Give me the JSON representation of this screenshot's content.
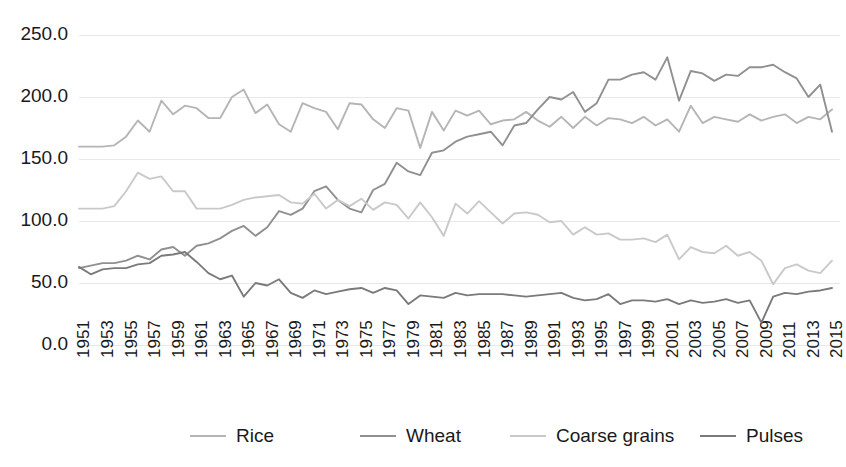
{
  "chart_data": {
    "type": "line",
    "title": "",
    "subtitle": "",
    "xlabel": "",
    "ylabel": "",
    "ylim": [
      0,
      250
    ],
    "ytick_labels": [
      "0.0",
      "50.0",
      "100.0",
      "150.0",
      "200.0",
      "250.0"
    ],
    "ytick_values": [
      0,
      50,
      100,
      150,
      200,
      250
    ],
    "grid": true,
    "legend_position": "bottom",
    "x": [
      1951,
      1952,
      1953,
      1954,
      1955,
      1956,
      1957,
      1958,
      1959,
      1960,
      1961,
      1962,
      1963,
      1964,
      1965,
      1966,
      1967,
      1968,
      1969,
      1970,
      1971,
      1972,
      1973,
      1974,
      1975,
      1976,
      1977,
      1978,
      1979,
      1980,
      1981,
      1982,
      1983,
      1984,
      1985,
      1986,
      1987,
      1988,
      1989,
      1990,
      1991,
      1992,
      1993,
      1994,
      1995,
      1996,
      1997,
      1998,
      1999,
      2000,
      2001,
      2002,
      2003,
      2004,
      2005,
      2006,
      2007,
      2008,
      2009,
      2010,
      2011,
      2012,
      2013,
      2014,
      2015
    ],
    "xtick_labels": [
      "1951",
      "1953",
      "1955",
      "1957",
      "1959",
      "1961",
      "1963",
      "1965",
      "1967",
      "1969",
      "1971",
      "1973",
      "1975",
      "1977",
      "1979",
      "1981",
      "1983",
      "1985",
      "1987",
      "1989",
      "1991",
      "1993",
      "1995",
      "1997",
      "1999",
      "2001",
      "2003",
      "2005",
      "2007",
      "2009",
      "2011",
      "2013",
      "2015"
    ],
    "series": [
      {
        "name": "Rice",
        "color": "#b5b5b5",
        "values": [
          160,
          160,
          160,
          161,
          168,
          181,
          172,
          197,
          186,
          193,
          191,
          183,
          183,
          200,
          206,
          187,
          194,
          178,
          172,
          195,
          191,
          188,
          174,
          195,
          194,
          182,
          175,
          191,
          189,
          159,
          188,
          173,
          189,
          185,
          189,
          178,
          181,
          182,
          188,
          181,
          176,
          184,
          175,
          184,
          177,
          183,
          182,
          179,
          184,
          177,
          182,
          172,
          193,
          179,
          184,
          182,
          180,
          186,
          181,
          184,
          186,
          179,
          184,
          182,
          190
        ],
        "endpoint_note": "line terminates near 190 at 2015"
      },
      {
        "name": "Wheat",
        "color": "#909090",
        "values": [
          62,
          64,
          66,
          66,
          68,
          72,
          69,
          77,
          79,
          72,
          80,
          82,
          86,
          92,
          96,
          88,
          95,
          108,
          105,
          110,
          124,
          128,
          117,
          110,
          107,
          125,
          130,
          147,
          140,
          137,
          155,
          157,
          164,
          168,
          170,
          172,
          161,
          177,
          179,
          190,
          200,
          198,
          204,
          188,
          195,
          214,
          214,
          218,
          220,
          214,
          232,
          197,
          221,
          219,
          213,
          218,
          217,
          224,
          224,
          226,
          220,
          215,
          200,
          210,
          172
        ],
        "endpoint_note": "after 2001 peak of 232 the series ends near 172 at 2015"
      },
      {
        "name": "Coarse grains",
        "color": "#c9c9c9",
        "values": [
          110,
          110,
          110,
          112,
          124,
          139,
          134,
          136,
          124,
          124,
          110,
          110,
          110,
          113,
          117,
          119,
          120,
          121,
          115,
          114,
          122,
          110,
          117,
          112,
          118,
          109,
          115,
          113,
          102,
          115,
          103,
          88,
          114,
          106,
          116,
          107,
          98,
          106,
          107,
          105,
          99,
          100,
          89,
          95,
          89,
          90,
          85,
          85,
          86,
          83,
          89,
          69,
          79,
          75,
          74,
          80,
          72,
          75,
          68,
          49,
          62,
          65,
          60,
          58,
          68
        ],
        "endpoint_note": "declines from ~139 mid-1950s to ~68 by 2015"
      },
      {
        "name": "Pulses",
        "color": "#7a7a7a",
        "values": [
          63,
          57,
          61,
          62,
          62,
          65,
          66,
          72,
          73,
          75,
          67,
          58,
          53,
          56,
          39,
          50,
          48,
          53,
          42,
          38,
          44,
          41,
          43,
          45,
          46,
          42,
          46,
          44,
          33,
          40,
          39,
          38,
          42,
          40,
          41,
          41,
          41,
          40,
          39,
          40,
          41,
          42,
          38,
          36,
          37,
          41,
          33,
          36,
          36,
          35,
          37,
          33,
          36,
          34,
          35,
          37,
          34,
          36,
          18,
          39,
          42,
          41,
          43,
          44,
          46
        ],
        "endpoint_note": "lowest series, dips to ~18 in 2009 then recovers to ~46"
      }
    ]
  },
  "legend": {
    "items": [
      {
        "label": "Rice",
        "color": "#b5b5b5"
      },
      {
        "label": "Wheat",
        "color": "#909090"
      },
      {
        "label": "Coarse grains",
        "color": "#c9c9c9"
      },
      {
        "label": "Pulses",
        "color": "#7a7a7a"
      }
    ]
  },
  "axes": {
    "grid_color": "#e8e8e8",
    "text_color": "#1a1a1a"
  }
}
